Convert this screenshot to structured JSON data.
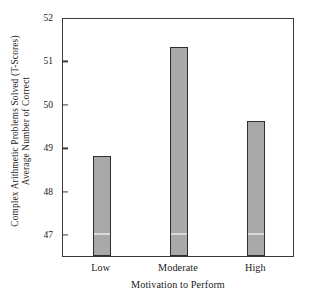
{
  "chart_data": {
    "type": "bar",
    "title": "",
    "categories": [
      "Low",
      "Moderate",
      "High"
    ],
    "values": [
      48.8,
      51.3,
      49.6
    ],
    "series": [
      {
        "name": "Average Number of Correct Complex Arithmetic Problems Solved (T-Scores)",
        "values": [
          48.8,
          51.3,
          49.6
        ]
      }
    ],
    "xlabel": "Motivation to Perform",
    "ylabel": "Average Number of Correct Complex Arithmetic Problems Solved (T-Scores)",
    "ylabel_lines": [
      "Average Number of Correct",
      "Complex Arithmetic Problems Solved (T-Scores)"
    ],
    "ylim": [
      46.5,
      52.0
    ],
    "yticks": [
      47,
      48,
      49,
      50,
      51,
      52
    ],
    "ytick_labels": [
      "47",
      "48",
      "49",
      "50",
      "51",
      "52"
    ],
    "grid": false,
    "legend": false,
    "legend_position": "none",
    "bar_color": "#a9a9a9",
    "bar_edge_color": "#2e2e2e",
    "axis_color": "#3a3a3a",
    "background_color": "#ffffff",
    "bar_width_fraction": 0.23,
    "bar_midline_value": 47.0,
    "bar_midline_color": "#d9d9d9"
  }
}
